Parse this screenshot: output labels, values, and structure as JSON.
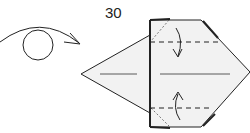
{
  "step": {
    "number": "30"
  },
  "diagram": {
    "icons": [
      "turn-over-icon",
      "valley-fold-arrow-down-icon",
      "valley-fold-arrow-up-icon"
    ],
    "colors": {
      "paper": "#f2f2f2",
      "line": "#222222",
      "background": "#ffffff"
    }
  }
}
